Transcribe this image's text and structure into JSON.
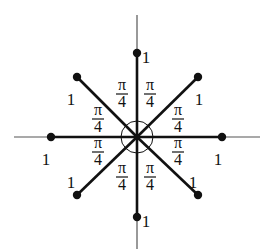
{
  "diagram": {
    "center": [
      137,
      137
    ],
    "colors": {
      "ink": "#111111",
      "axis": "#555555",
      "background": "#ffffff"
    },
    "axes": {
      "horizontal": {
        "x1": 14,
        "x2": 260,
        "y": 137
      },
      "vertical": {
        "x": 137,
        "y1": 15,
        "y2": 249
      }
    },
    "vectors": [
      {
        "name": "up",
        "end": [
          137,
          53
        ],
        "label": "1",
        "label_pos": [
          146,
          59
        ]
      },
      {
        "name": "up-right",
        "end": [
          198,
          77
        ],
        "label": "1",
        "label_pos": [
          199,
          101
        ]
      },
      {
        "name": "right",
        "end": [
          222,
          137
        ],
        "label": "1",
        "label_pos": [
          218,
          161
        ]
      },
      {
        "name": "down-right",
        "end": [
          198,
          195
        ],
        "label": "1",
        "label_pos": [
          193,
          184
        ]
      },
      {
        "name": "down",
        "end": [
          137,
          217
        ],
        "label": "1",
        "label_pos": [
          146,
          223
        ]
      },
      {
        "name": "down-left",
        "end": [
          77,
          195
        ],
        "label": "1",
        "label_pos": [
          71,
          184
        ]
      },
      {
        "name": "left",
        "end": [
          51,
          137
        ],
        "label": "1",
        "label_pos": [
          46,
          161
        ]
      },
      {
        "name": "up-left",
        "end": [
          77,
          77
        ],
        "label": "1",
        "label_pos": [
          71,
          101
        ]
      }
    ],
    "angle_labels": {
      "numerator": "π",
      "denominator": "4",
      "positions": [
        [
          122,
          94
        ],
        [
          150,
          94
        ],
        [
          98,
          119
        ],
        [
          178,
          119
        ],
        [
          98,
          152
        ],
        [
          178,
          152
        ],
        [
          122,
          177
        ],
        [
          150,
          177
        ]
      ]
    },
    "angle_arc_radius": 16
  }
}
